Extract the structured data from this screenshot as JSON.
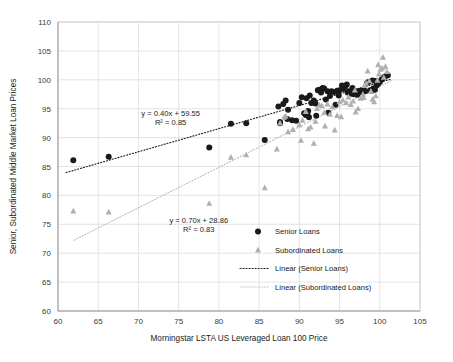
{
  "chart_data": {
    "type": "scatter",
    "title": "",
    "xlabel": "Morningstar LSTA US Leveraged Loan 100 Price",
    "ylabel": "Senior, Subordinated Middle Market Loan Prices",
    "xlim": [
      60,
      105
    ],
    "ylim": [
      60,
      110
    ],
    "xticks": [
      60,
      65,
      70,
      75,
      80,
      85,
      90,
      95,
      100,
      105
    ],
    "yticks": [
      60,
      65,
      70,
      75,
      80,
      85,
      90,
      95,
      100,
      105,
      110
    ],
    "grid": true,
    "legend_position": "center-right",
    "series": [
      {
        "name": "Senior Loans",
        "marker": "circle",
        "color": "#1a1a1a",
        "points": [
          [
            61.9,
            86.1
          ],
          [
            66.3,
            86.7
          ],
          [
            78.8,
            88.3
          ],
          [
            81.5,
            92.4
          ],
          [
            83.4,
            92.5
          ],
          [
            85.7,
            89.6
          ],
          [
            87.4,
            95.4
          ],
          [
            87.6,
            92.7
          ],
          [
            87.6,
            92.5
          ],
          [
            88.0,
            95.8
          ],
          [
            88.3,
            96.4
          ],
          [
            88.5,
            93.2
          ],
          [
            88.6,
            94.8
          ],
          [
            89.1,
            93.0
          ],
          [
            90.0,
            96.0
          ],
          [
            90.3,
            97.0
          ],
          [
            90.6,
            94.2
          ],
          [
            90.8,
            93.9
          ],
          [
            91.0,
            94.0
          ],
          [
            91.1,
            94.6
          ],
          [
            91.3,
            97.3
          ],
          [
            91.5,
            96.0
          ],
          [
            91.8,
            96.4
          ],
          [
            92.0,
            95.9
          ],
          [
            92.3,
            98.2
          ],
          [
            92.5,
            98.3
          ],
          [
            92.7,
            97.8
          ],
          [
            92.9,
            98.6
          ],
          [
            93.1,
            98.5
          ],
          [
            93.3,
            96.6
          ],
          [
            93.5,
            98.0
          ],
          [
            93.8,
            97.2
          ],
          [
            94.0,
            98.0
          ],
          [
            94.3,
            97.9
          ],
          [
            94.5,
            95.7
          ],
          [
            94.7,
            98.1
          ],
          [
            95.0,
            98.2
          ],
          [
            95.3,
            99.0
          ],
          [
            95.5,
            98.4
          ],
          [
            95.7,
            98.8
          ],
          [
            96.0,
            97.8
          ],
          [
            96.2,
            98.0
          ],
          [
            96.5,
            97.6
          ],
          [
            96.8,
            97.5
          ],
          [
            97.0,
            98.0
          ],
          [
            97.2,
            97.4
          ],
          [
            97.4,
            97.8
          ],
          [
            97.6,
            98.1
          ],
          [
            97.8,
            97.9
          ],
          [
            98.0,
            98.3
          ],
          [
            98.2,
            98.0
          ],
          [
            98.4,
            99.4
          ],
          [
            98.6,
            99.6
          ],
          [
            98.8,
            98.2
          ],
          [
            99.0,
            98.1
          ],
          [
            99.2,
            98.5
          ],
          [
            99.4,
            98.3
          ],
          [
            99.6,
            99.0
          ],
          [
            99.8,
            99.3
          ],
          [
            100.0,
            99.6
          ],
          [
            100.2,
            100.0
          ],
          [
            100.4,
            100.3
          ],
          [
            100.6,
            100.5
          ],
          [
            100.8,
            100.7
          ],
          [
            101.0,
            100.8
          ],
          [
            99.1,
            99.9
          ],
          [
            99.5,
            99.8
          ],
          [
            96.6,
            98.6
          ],
          [
            95.9,
            99.2
          ],
          [
            94.9,
            97.3
          ],
          [
            93.6,
            94.3
          ],
          [
            92.1,
            93.8
          ],
          [
            91.2,
            93.5
          ],
          [
            90.9,
            96.8
          ],
          [
            89.6,
            92.9
          ]
        ]
      },
      {
        "name": "Subordinated Loans",
        "marker": "triangle",
        "color": "#b0b0b0",
        "points": [
          [
            61.9,
            77.3
          ],
          [
            66.3,
            77.1
          ],
          [
            78.8,
            78.6
          ],
          [
            81.5,
            86.6
          ],
          [
            83.4,
            87.0
          ],
          [
            85.7,
            81.3
          ],
          [
            87.2,
            88.0
          ],
          [
            87.6,
            92.5
          ],
          [
            88.1,
            93.5
          ],
          [
            88.3,
            93.7
          ],
          [
            88.6,
            91.0
          ],
          [
            89.2,
            91.4
          ],
          [
            90.0,
            92.2
          ],
          [
            90.4,
            93.0
          ],
          [
            90.8,
            94.5
          ],
          [
            91.1,
            91.5
          ],
          [
            91.4,
            91.8
          ],
          [
            91.8,
            89.0
          ],
          [
            92.2,
            95.0
          ],
          [
            92.5,
            95.6
          ],
          [
            92.8,
            95.5
          ],
          [
            93.1,
            94.3
          ],
          [
            93.5,
            95.8
          ],
          [
            93.8,
            94.0
          ],
          [
            94.1,
            95.3
          ],
          [
            94.4,
            91.3
          ],
          [
            94.7,
            93.8
          ],
          [
            95.0,
            96.2
          ],
          [
            95.4,
            96.5
          ],
          [
            95.8,
            96.0
          ],
          [
            96.1,
            97.0
          ],
          [
            96.4,
            95.7
          ],
          [
            96.7,
            96.3
          ],
          [
            97.0,
            94.4
          ],
          [
            97.3,
            95.0
          ],
          [
            97.6,
            96.8
          ],
          [
            97.9,
            97.5
          ],
          [
            98.1,
            99.0
          ],
          [
            98.3,
            99.4
          ],
          [
            98.5,
            101.5
          ],
          [
            98.7,
            99.8
          ],
          [
            98.9,
            98.0
          ],
          [
            99.1,
            96.6
          ],
          [
            99.3,
            96.2
          ],
          [
            99.5,
            97.2
          ],
          [
            99.7,
            99.9
          ],
          [
            99.9,
            101.0
          ],
          [
            100.1,
            101.8
          ],
          [
            100.3,
            102.0
          ],
          [
            100.5,
            100.4
          ],
          [
            100.7,
            102.3
          ],
          [
            100.9,
            101.4
          ],
          [
            100.4,
            103.9
          ],
          [
            99.8,
            102.6
          ],
          [
            98.0,
            96.9
          ],
          [
            96.9,
            98.2
          ],
          [
            95.2,
            93.6
          ],
          [
            93.2,
            92.0
          ],
          [
            92.0,
            92.8
          ],
          [
            90.2,
            89.5
          ]
        ]
      }
    ],
    "trendlines": [
      {
        "name": "Linear (Senior Loans)",
        "equation": "y = 0.40x + 59.55",
        "r2_label": "R² = 0.85",
        "slope": 0.4,
        "intercept": 59.55,
        "r2": 0.85,
        "color": "#1a1a1a",
        "style": "dotted",
        "x_start": 61.0,
        "x_end": 101.5
      },
      {
        "name": "Linear (Subordinated Loans)",
        "equation": "y = 0.70x + 28.86",
        "r2_label": "R² = 0.83",
        "slope": 0.7,
        "intercept": 28.86,
        "r2": 0.83,
        "color": "#bdbdbd",
        "style": "dotted",
        "x_start": 62.0,
        "x_end": 101.5
      }
    ],
    "annotations": [
      {
        "id": "senior-eq",
        "line1": "y = 0.40x + 59.55",
        "line2": "R² = 0.85",
        "x": 74.0,
        "y": 93.8
      },
      {
        "id": "sub-eq",
        "line1": "y = 0.70x + 28.86",
        "line2": "R² = 0.83",
        "x": 77.5,
        "y": 75.3
      }
    ],
    "legend": [
      {
        "label": "Senior Loans",
        "type": "marker",
        "marker": "circle",
        "color": "#1a1a1a"
      },
      {
        "label": "Subordinated Loans",
        "type": "marker",
        "marker": "triangle",
        "color": "#b0b0b0"
      },
      {
        "label": "Linear (Senior Loans)",
        "type": "line",
        "style": "dotted",
        "color": "#1a1a1a"
      },
      {
        "label": "Linear (Subordinated Loans)",
        "type": "line",
        "style": "dotted",
        "color": "#c4c4c4"
      }
    ]
  }
}
